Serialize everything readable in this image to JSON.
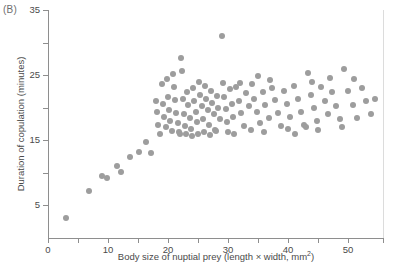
{
  "panel": {
    "label": "(B)"
  },
  "axes": {
    "xlabel_prefix": "Body size of nuptial prey (length × width, mm",
    "xlabel_sup": "2",
    "xlabel_suffix": ")",
    "ylabel": "Duration of copulation (minutes)",
    "x_ticks_major": [
      0,
      10,
      20,
      30,
      40,
      50
    ],
    "x_ticks_minor": [
      5,
      15,
      25,
      35,
      45
    ],
    "y_ticks_major": [
      5,
      15,
      25,
      35
    ],
    "y_ticks_minor": [
      10,
      20,
      30
    ],
    "xlim": [
      0,
      56
    ],
    "ylim": [
      0,
      35
    ],
    "grid": false,
    "axis_color": "#8e8e8e",
    "right_border_color": "#dcdcdc"
  },
  "style": {
    "point_color": "#9d9d9d",
    "point_diameter_px": 6,
    "background": "#ffffff"
  },
  "chart_data": {
    "type": "scatter",
    "title": "",
    "subtitle": "",
    "panel_label": "(B)",
    "xlabel": "Body size of nuptial prey (length × width, mm2)",
    "ylabel": "Duration of copulation (minutes)",
    "xlim": [
      0,
      56
    ],
    "ylim": [
      0,
      35
    ],
    "xticks": [
      0,
      5,
      10,
      15,
      20,
      25,
      30,
      35,
      40,
      45,
      50
    ],
    "xtick_labels": [
      "0",
      "",
      "10",
      "",
      "20",
      "",
      "30",
      "",
      "40",
      "",
      "50"
    ],
    "yticks": [
      5,
      10,
      15,
      20,
      25,
      30,
      35
    ],
    "ytick_labels": [
      "5",
      "",
      "15",
      "",
      "25",
      "",
      "35"
    ],
    "grid": false,
    "legend": null,
    "marker": "filled-circle",
    "marker_color": "#9d9d9d",
    "n_points": 128,
    "annotations": [],
    "points": [
      [
        3.0,
        3.0
      ],
      [
        6.8,
        7.2
      ],
      [
        9.0,
        9.5
      ],
      [
        9.8,
        9.2
      ],
      [
        11.5,
        11.0
      ],
      [
        12.2,
        10.2
      ],
      [
        13.6,
        12.4
      ],
      [
        15.2,
        13.2
      ],
      [
        16.4,
        14.8
      ],
      [
        17.2,
        13.0
      ],
      [
        18.0,
        21.0
      ],
      [
        18.2,
        19.4
      ],
      [
        18.4,
        17.4
      ],
      [
        18.6,
        15.9
      ],
      [
        19.0,
        23.6
      ],
      [
        19.2,
        20.6
      ],
      [
        19.4,
        18.6
      ],
      [
        19.6,
        17.0
      ],
      [
        20.0,
        21.6
      ],
      [
        20.2,
        19.6
      ],
      [
        20.4,
        18.0
      ],
      [
        20.6,
        16.4
      ],
      [
        21.0,
        23.2
      ],
      [
        21.2,
        21.2
      ],
      [
        21.4,
        19.2
      ],
      [
        21.6,
        17.6
      ],
      [
        21.8,
        16.2
      ],
      [
        22.2,
        27.6
      ],
      [
        22.3,
        25.6
      ],
      [
        22.5,
        21.4
      ],
      [
        22.7,
        19.0
      ],
      [
        22.9,
        17.2
      ],
      [
        23.2,
        22.4
      ],
      [
        23.4,
        20.4
      ],
      [
        23.6,
        18.4
      ],
      [
        23.8,
        16.8
      ],
      [
        24.2,
        23.0
      ],
      [
        24.4,
        21.0
      ],
      [
        24.6,
        19.4
      ],
      [
        24.8,
        17.8
      ],
      [
        25.2,
        24.0
      ],
      [
        25.4,
        22.0
      ],
      [
        25.6,
        20.2
      ],
      [
        25.8,
        18.2
      ],
      [
        26.2,
        23.4
      ],
      [
        26.4,
        21.4
      ],
      [
        26.6,
        19.6
      ],
      [
        26.8,
        17.4
      ],
      [
        27.2,
        22.6
      ],
      [
        27.4,
        20.8
      ],
      [
        27.6,
        19.0
      ],
      [
        27.8,
        16.6
      ],
      [
        28.2,
        21.8
      ],
      [
        28.4,
        20.0
      ],
      [
        28.6,
        18.2
      ],
      [
        29.0,
        31.0
      ],
      [
        29.2,
        23.8
      ],
      [
        29.4,
        21.6
      ],
      [
        29.6,
        19.8
      ],
      [
        29.8,
        17.8
      ],
      [
        30.3,
        22.8
      ],
      [
        30.6,
        20.6
      ],
      [
        30.9,
        18.6
      ],
      [
        31.4,
        23.2
      ],
      [
        31.8,
        21.0
      ],
      [
        32.2,
        19.2
      ],
      [
        32.6,
        17.2
      ],
      [
        33.0,
        22.2
      ],
      [
        33.5,
        20.2
      ],
      [
        34.0,
        23.6
      ],
      [
        34.4,
        21.4
      ],
      [
        34.8,
        19.4
      ],
      [
        35.3,
        17.6
      ],
      [
        35.8,
        22.4
      ],
      [
        36.2,
        20.4
      ],
      [
        36.8,
        18.4
      ],
      [
        37.3,
        23.0
      ],
      [
        37.8,
        21.2
      ],
      [
        38.3,
        19.2
      ],
      [
        38.8,
        17.2
      ],
      [
        39.4,
        22.6
      ],
      [
        39.9,
        20.6
      ],
      [
        40.4,
        18.6
      ],
      [
        41.0,
        23.4
      ],
      [
        41.6,
        21.4
      ],
      [
        42.1,
        19.4
      ],
      [
        42.7,
        17.4
      ],
      [
        43.3,
        25.4
      ],
      [
        43.8,
        22.0
      ],
      [
        44.3,
        20.0
      ],
      [
        44.9,
        18.0
      ],
      [
        45.5,
        23.2
      ],
      [
        46.1,
        21.0
      ],
      [
        46.7,
        19.0
      ],
      [
        47.4,
        22.4
      ],
      [
        48.0,
        20.2
      ],
      [
        48.7,
        18.2
      ],
      [
        49.4,
        26.0
      ],
      [
        50.0,
        22.6
      ],
      [
        50.8,
        20.4
      ],
      [
        51.5,
        18.4
      ],
      [
        52.3,
        23.0
      ],
      [
        53.0,
        21.0
      ],
      [
        53.8,
        19.0
      ],
      [
        54.5,
        21.4
      ],
      [
        19.8,
        24.4
      ],
      [
        23.0,
        15.9
      ],
      [
        24.0,
        15.7
      ],
      [
        25.0,
        16.0
      ],
      [
        26.0,
        16.2
      ],
      [
        27.0,
        15.8
      ],
      [
        28.0,
        16.4
      ],
      [
        30.0,
        16.2
      ],
      [
        31.0,
        16.0
      ],
      [
        32.0,
        23.8
      ],
      [
        33.8,
        16.6
      ],
      [
        36.0,
        16.2
      ],
      [
        37.0,
        24.2
      ],
      [
        40.0,
        16.8
      ],
      [
        41.2,
        16.0
      ],
      [
        44.0,
        24.0
      ],
      [
        45.0,
        16.6
      ],
      [
        47.0,
        24.6
      ],
      [
        49.0,
        17.0
      ],
      [
        51.0,
        24.4
      ],
      [
        20.8,
        25.2
      ],
      [
        22.0,
        16.0
      ],
      [
        35.0,
        24.8
      ],
      [
        43.0,
        17.0
      ]
    ]
  }
}
